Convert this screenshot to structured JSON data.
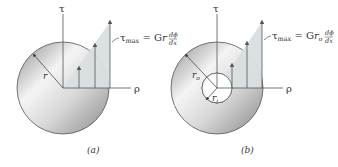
{
  "figures": [
    {
      "id": "a",
      "caption": "(a)",
      "shape": "solid circular shaft",
      "axis_vertical": "τ",
      "axis_horizontal": "ρ",
      "radius_label": "r",
      "formula": {
        "lhs": "τ",
        "lhs_sub": "max",
        "eq": " = G",
        "var": "r",
        "frac_num": "dϕ",
        "frac_den": "dx"
      }
    },
    {
      "id": "b",
      "caption": "(b)",
      "shape": "hollow circular shaft",
      "axis_vertical": "τ",
      "axis_horizontal": "ρ",
      "outer_radius_label": "r",
      "outer_radius_sub": "o",
      "inner_radius_label": "r",
      "inner_radius_sub": "i",
      "formula": {
        "lhs": "τ",
        "lhs_sub": "max",
        "eq": " = G",
        "var": "r",
        "var_sub": "o",
        "frac_num": "dϕ",
        "frac_den": "dx"
      }
    }
  ],
  "colors": {
    "stress_fill": "#d7dde0",
    "disk_dark": "#9a9a9a",
    "disk_light": "#f2f2f2",
    "line": "#555555"
  }
}
